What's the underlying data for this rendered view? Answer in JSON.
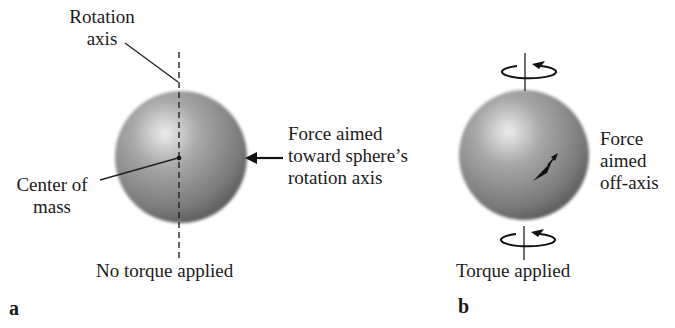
{
  "panel_a": {
    "letter": "a",
    "rotation_axis_label": [
      "Rotation",
      "axis"
    ],
    "center_of_mass_label": [
      "Center of",
      "mass"
    ],
    "force_label": [
      "Force aimed",
      "toward sphere’s",
      "rotation axis"
    ],
    "caption": "No torque applied",
    "icons": [
      "dashed-rotation-axis",
      "center-of-mass-dot",
      "force-arrow-left"
    ]
  },
  "panel_b": {
    "letter": "b",
    "force_label": [
      "Force",
      "aimed",
      "off-axis"
    ],
    "caption": "Torque applied",
    "icons": [
      "rotation-arrow-top",
      "rotation-arrow-bottom",
      "force-arrow-off-axis"
    ]
  },
  "colors": {
    "sphere_highlight": "#e6e6e6",
    "sphere_mid": "#9a9a9a",
    "sphere_edge": "#5e5e5e",
    "ink": "#1a1a1a"
  }
}
